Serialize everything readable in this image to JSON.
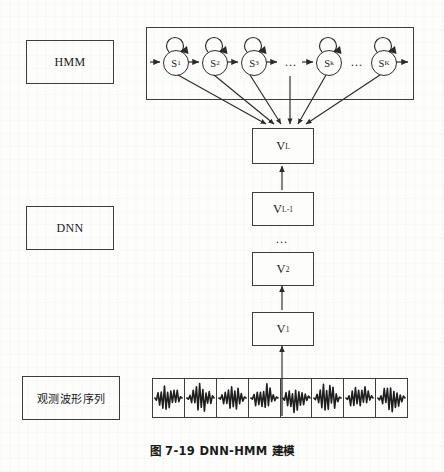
{
  "figure": {
    "caption": "图 7-19    DNN-HMM 建模",
    "background_color": "#fdfdfc",
    "line_color": "#3d3d3d"
  },
  "left_labels": [
    {
      "id": "hmm",
      "text": "HMM",
      "script": "latin"
    },
    {
      "id": "dnn",
      "text": "DNN",
      "script": "latin"
    },
    {
      "id": "obs",
      "text": "观测波形序列",
      "script": "cjk"
    }
  ],
  "hmm_layer": {
    "container_label": "HMM",
    "states": [
      {
        "label": "S",
        "sub": "1"
      },
      {
        "label": "S",
        "sub": "2"
      },
      {
        "label": "S",
        "sub": "3"
      },
      {
        "label": "S",
        "sub": "k"
      },
      {
        "label": "S",
        "sub": "K"
      }
    ],
    "gap_markers": [
      "...",
      "..."
    ],
    "has_self_loops": true,
    "entry_arrow": true,
    "exit_arrow": true
  },
  "dnn_layer": {
    "boxes": [
      {
        "label": "V",
        "sub": "L"
      },
      {
        "label": "V",
        "sub": "L-1"
      },
      {
        "label": "V",
        "sub": "2"
      },
      {
        "label": "V",
        "sub": "1"
      }
    ],
    "vertical_ellipsis": "..."
  },
  "observation_layer": {
    "cell_count": 8,
    "label": "观测波形序列"
  },
  "chart_data": {
    "type": "diagram",
    "title": "图 7-19    DNN-HMM 建模",
    "layers": [
      "HMM",
      "DNN",
      "观测波形序列"
    ],
    "nodes": [
      "S1",
      "S2",
      "S3",
      "Sk",
      "SK",
      "VL",
      "VL-1",
      "V2",
      "V1"
    ],
    "edges": [
      "S1->VL",
      "S2->VL",
      "S3->VL",
      "gap->VL",
      "Sk->VL",
      "SK->VL",
      "VL-1->VL",
      "V1->V2",
      "waveform->V1",
      "S1->S2",
      "S2->S3",
      "S3->...",
      "...->Sk",
      "Sk->...",
      "...->SK"
    ]
  }
}
